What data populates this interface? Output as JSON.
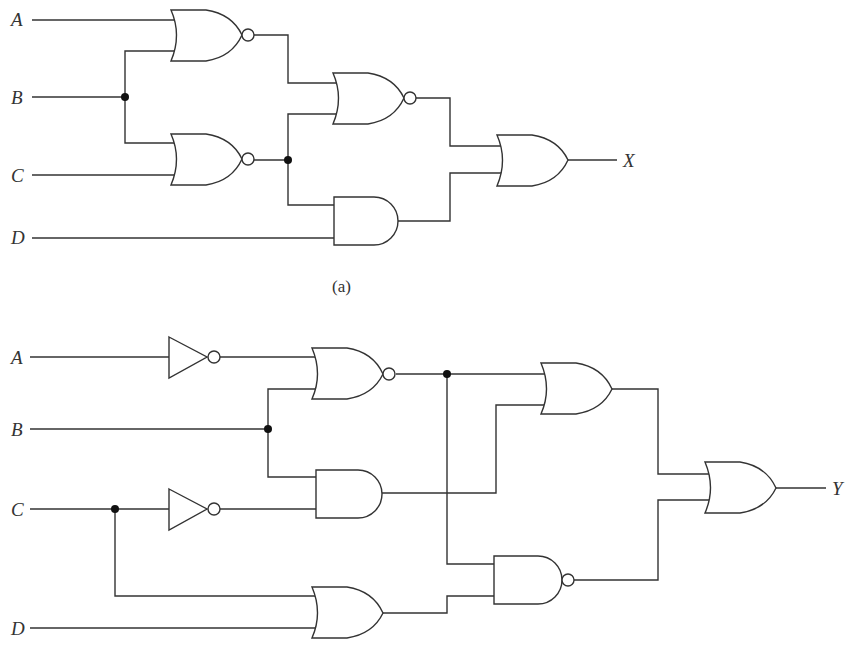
{
  "diagram_a": {
    "caption": "(a)",
    "inputs": {
      "A": "A",
      "B": "B",
      "C": "C",
      "D": "D"
    },
    "output": "X",
    "gates": [
      {
        "id": "g1",
        "type": "NOR",
        "inputs": [
          "A",
          "B"
        ]
      },
      {
        "id": "g2",
        "type": "NOR",
        "inputs": [
          "B",
          "C"
        ]
      },
      {
        "id": "g3",
        "type": "NOR",
        "inputs": [
          "g1",
          "g2"
        ]
      },
      {
        "id": "g4",
        "type": "AND",
        "inputs": [
          "g2",
          "D"
        ]
      },
      {
        "id": "g5",
        "type": "OR",
        "inputs": [
          "g3",
          "g4"
        ],
        "output": "X"
      }
    ]
  },
  "diagram_b": {
    "inputs": {
      "A": "A",
      "B": "B",
      "C": "C",
      "D": "D"
    },
    "output": "Y",
    "gates": [
      {
        "id": "n1",
        "type": "NOT",
        "inputs": [
          "A"
        ]
      },
      {
        "id": "n2",
        "type": "NOT",
        "inputs": [
          "C"
        ]
      },
      {
        "id": "h1",
        "type": "NOR",
        "inputs": [
          "n1",
          "B"
        ]
      },
      {
        "id": "h2",
        "type": "AND",
        "inputs": [
          "B",
          "n2"
        ]
      },
      {
        "id": "h3",
        "type": "OR",
        "inputs": [
          "C",
          "D"
        ]
      },
      {
        "id": "h4",
        "type": "OR",
        "inputs": [
          "h1",
          "h2"
        ]
      },
      {
        "id": "h5",
        "type": "NAND",
        "inputs": [
          "h1",
          "h3"
        ]
      },
      {
        "id": "h6",
        "type": "OR",
        "inputs": [
          "h4",
          "h5"
        ],
        "output": "Y"
      }
    ]
  }
}
